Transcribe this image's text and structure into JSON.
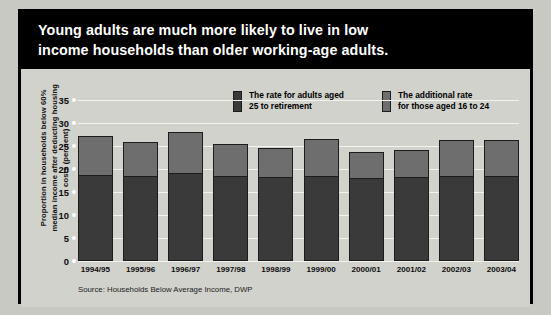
{
  "title": {
    "line1": "Young adults are much more likely to live in low",
    "line2": "income households than older working-age adults."
  },
  "legend": [
    {
      "label_line1": "The rate for adults aged",
      "label_line2": "25 to retirement",
      "swatch": "dark",
      "color": "#3a3a3a"
    },
    {
      "label_line1": "The additional rate",
      "label_line2": "for those aged 16 to 24",
      "swatch": "light",
      "color": "#6e6e6e"
    }
  ],
  "source": "Source: Households Below Average Income, DWP",
  "colors": {
    "banner_background": "#000000",
    "banner_text": "#ffffff",
    "plot_background": "#d2d2cd",
    "gridline": "#f2f2ee",
    "series_dark": "#3a3a3a",
    "series_light": "#6e6e6e",
    "frame": "#000000"
  },
  "chart_data": {
    "type": "bar",
    "title": "Young adults are much more likely to live in low income households than older working-age adults.",
    "subtitle": "",
    "xlabel": "",
    "ylabel": "Proportion in households below 60% median income after deducting housing costs (per cent)",
    "ylim": [
      0,
      35
    ],
    "yticks": [
      0,
      5,
      10,
      15,
      20,
      25,
      30,
      35
    ],
    "ytick_labels": [
      "0",
      "5",
      "10",
      "15",
      "20",
      "25",
      "30",
      "35"
    ],
    "grid": true,
    "stacked": true,
    "legend_position": "top-right",
    "categories": [
      "1994/95",
      "1995/96",
      "1996/97",
      "1997/98",
      "1998/99",
      "1999/00",
      "2000/01",
      "2001/02",
      "2002/03",
      "2003/04"
    ],
    "series": [
      {
        "name": "The rate for adults aged 25 to retirement",
        "color": "#3a3a3a",
        "values": [
          18.7,
          18.6,
          19.3,
          18.6,
          18.4,
          18.6,
          18.2,
          18.3,
          18.6,
          18.5
        ]
      },
      {
        "name": "The additional rate for those aged 16 to 24",
        "color": "#6e6e6e",
        "values": [
          8.4,
          7.3,
          8.7,
          6.8,
          6.2,
          7.9,
          5.5,
          5.9,
          7.7,
          7.8
        ]
      }
    ],
    "totals": [
      27.1,
      25.9,
      28.0,
      25.4,
      24.6,
      26.5,
      23.7,
      24.2,
      26.3,
      26.3
    ]
  }
}
